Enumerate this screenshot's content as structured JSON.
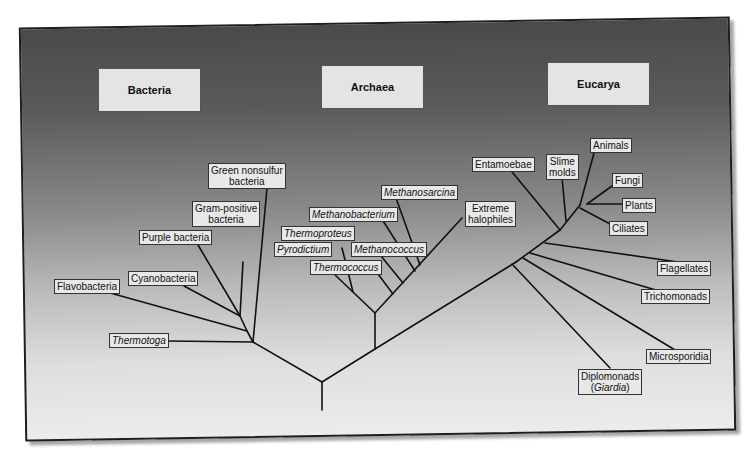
{
  "domains": {
    "bacteria": "Bacteria",
    "archaea": "Archaea",
    "eucarya": "Eucarya"
  },
  "bacteria": {
    "green_nonsulfur": [
      "Green nonsulfur",
      "bacteria"
    ],
    "gram_positive": [
      "Gram-positive",
      "bacteria"
    ],
    "purple": "Purple bacteria",
    "cyanobacteria": "Cyanobacteria",
    "flavobacteria": "Flavobacteria",
    "thermotoga": "Thermotoga"
  },
  "archaea": {
    "methanosarcina": "Methanosarcina",
    "methanobacterium": "Methanobacterium",
    "thermoproteus": "Thermoproteus",
    "pyrodictium": "Pyrodictium",
    "methanococcus": "Methanococcus",
    "thermococcus": "Thermococcus",
    "extreme_halophiles": [
      "Extreme",
      "halophiles"
    ]
  },
  "eucarya": {
    "entamoebae": "Entamoebae",
    "slime_molds": [
      "Slime",
      "molds"
    ],
    "animals": "Animals",
    "fungi": "Fungi",
    "plants": "Plants",
    "ciliates": "Ciliates",
    "flagellates": "Flagellates",
    "trichomonads": "Trichomonads",
    "microsporidia": "Microsporidia",
    "diplomonads": [
      "Diplomonads",
      "Giardia"
    ]
  }
}
